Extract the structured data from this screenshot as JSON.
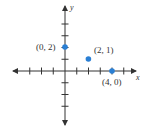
{
  "chart_data": {
    "type": "scatter",
    "title": "",
    "xlabel": "x",
    "ylabel": "y",
    "xlim": [
      -4.5,
      6
    ],
    "ylim": [
      -4.5,
      5.5
    ],
    "grid": false,
    "x": [
      0,
      2,
      4
    ],
    "y": [
      2,
      1,
      0
    ],
    "points": [
      {
        "x": 0,
        "y": 2,
        "label": "(0, 2)"
      },
      {
        "x": 2,
        "y": 1,
        "label": "(2, 1)"
      },
      {
        "x": 4,
        "y": 0,
        "label": "(4, 0)"
      }
    ],
    "x_ticks": [
      -3,
      -2,
      -1,
      1,
      2,
      3,
      4,
      5
    ],
    "y_ticks": [
      -3,
      -2,
      -1,
      1,
      2,
      3,
      4
    ],
    "point_color": "#2a7fd4",
    "axis_color": "#333333"
  },
  "axes": {
    "x_label": "x",
    "y_label": "y"
  },
  "labels": {
    "p1": "(0, 2)",
    "p2": "(2, 1)",
    "p3": "(4, 0)"
  }
}
